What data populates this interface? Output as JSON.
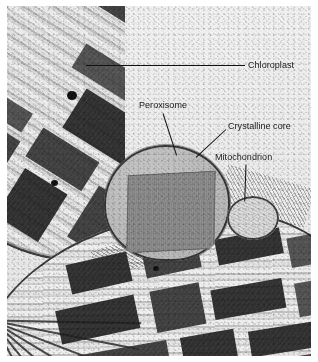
{
  "figure": {
    "kind": "electron-micrograph",
    "width": 318,
    "height": 362,
    "background_color": "#efefef",
    "label_color": "#17181a",
    "leader_color": "#101114"
  },
  "labels": [
    {
      "id": "chloroplast",
      "text": "Chloroplast",
      "x": 248,
      "y": 60,
      "leader": {
        "x": 86,
        "y": 65,
        "length": 159,
        "angle": 0
      }
    },
    {
      "id": "peroxisome",
      "text": "Peroxisome",
      "x": 139,
      "y": 100,
      "leader": {
        "x": 163,
        "y": 113,
        "length": 44,
        "angle": 72
      }
    },
    {
      "id": "crystalline-core",
      "text": "Crystalline core",
      "x": 228,
      "y": 121,
      "leader": {
        "x": 226,
        "y": 129,
        "length": 41,
        "angle": 137
      }
    },
    {
      "id": "mitochondrion",
      "text": "Mitochondrion",
      "x": 215,
      "y": 152,
      "leader": {
        "x": 246,
        "y": 164,
        "length": 37,
        "angle": 92
      }
    }
  ],
  "structures": [
    {
      "id": "chloroplast-upper",
      "name": "Chloroplast (upper left)",
      "feature": "grana stacks"
    },
    {
      "id": "chloroplast-lower",
      "name": "Chloroplast (lower)",
      "feature": "fanned lamellae and grana"
    },
    {
      "id": "peroxisome",
      "name": "Peroxisome",
      "feature": "rounded microbody"
    },
    {
      "id": "crystalline-core",
      "name": "Crystalline core",
      "feature": "catalase crystal inclusion"
    },
    {
      "id": "mitochondrion",
      "name": "Mitochondrion",
      "feature": "cristae"
    }
  ]
}
